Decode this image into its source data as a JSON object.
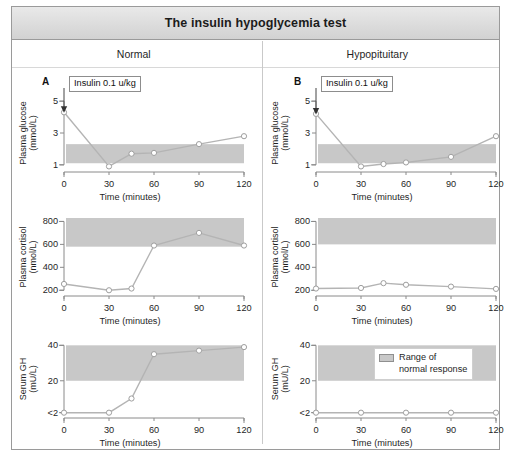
{
  "figure": {
    "title": "The insulin hypoglycemia test",
    "columns": [
      {
        "label": "Normal"
      },
      {
        "label": "Hypopituitary"
      }
    ],
    "panel_letters": {
      "normal": "A",
      "hypopituitary": "B"
    },
    "annotation": {
      "text": "Insulin 0.1 u/kg"
    },
    "legend": {
      "line1": "Range of",
      "line2": "normal response",
      "swatch_color": "#c8c8c8"
    },
    "colors": {
      "band": "#c8c8c8",
      "line": "#b4b4b4",
      "marker_fill": "#ffffff",
      "marker_stroke": "#9e9e9e",
      "axis": "#8a8a8a",
      "text": "#1f1f1f",
      "title_bg": "#dcdcdc",
      "frame": "#9a9a9a"
    }
  },
  "chart_data": [
    {
      "id": "glucose-normal",
      "type": "line",
      "panel": "A",
      "column": "Normal",
      "title": "",
      "ylabel_line1": "Plasma glucose",
      "ylabel_line2": "(mmol/L)",
      "xlabel": "Time (minutes)",
      "x": [
        0,
        30,
        45,
        60,
        90,
        120
      ],
      "values": [
        4.3,
        0.9,
        1.7,
        1.75,
        2.3,
        2.8
      ],
      "xticks": [
        0,
        30,
        60,
        90,
        120
      ],
      "xticklabels": [
        "0",
        "30",
        "60",
        "90",
        "120"
      ],
      "yticks": [
        1,
        3,
        5
      ],
      "yticklabels": [
        "1",
        "3",
        "5"
      ],
      "xlim": [
        0,
        120
      ],
      "ylim": [
        0.55,
        5.45
      ],
      "normal_band": [
        1.1,
        2.3
      ],
      "grid": false,
      "annotation_at_x": 0
    },
    {
      "id": "glucose-hypopituitary",
      "type": "line",
      "panel": "B",
      "column": "Hypopituitary",
      "title": "",
      "ylabel_line1": "Plasma glucose",
      "ylabel_line2": "(mmol/L)",
      "xlabel": "Time (minutes)",
      "x": [
        0,
        30,
        45,
        60,
        90,
        120
      ],
      "values": [
        4.2,
        0.9,
        1.05,
        1.15,
        1.5,
        2.8
      ],
      "xticks": [
        0,
        30,
        60,
        90,
        120
      ],
      "xticklabels": [
        "0",
        "30",
        "60",
        "90",
        "120"
      ],
      "yticks": [
        1,
        3,
        5
      ],
      "yticklabels": [
        "1",
        "3",
        "5"
      ],
      "xlim": [
        0,
        120
      ],
      "ylim": [
        0.55,
        5.45
      ],
      "normal_band": [
        1.1,
        2.3
      ],
      "grid": false,
      "annotation_at_x": 0
    },
    {
      "id": "cortisol-normal",
      "type": "line",
      "panel": "A",
      "column": "Normal",
      "title": "",
      "ylabel_line1": "Plasma cortisol",
      "ylabel_line2": "(nmol/L)",
      "xlabel": "Time (minutes)",
      "x": [
        0,
        30,
        45,
        60,
        90,
        120
      ],
      "values": [
        255,
        200,
        215,
        590,
        700,
        590
      ],
      "xticks": [
        0,
        30,
        60,
        90,
        120
      ],
      "xticklabels": [
        "0",
        "30",
        "60",
        "90",
        "120"
      ],
      "yticks": [
        200,
        400,
        600,
        800
      ],
      "yticklabels": [
        "200",
        "400",
        "600",
        "800"
      ],
      "xlim": [
        0,
        120
      ],
      "ylim": [
        150,
        830
      ],
      "normal_band": [
        580,
        830
      ],
      "grid": false
    },
    {
      "id": "cortisol-hypopituitary",
      "type": "line",
      "panel": "B",
      "column": "Hypopituitary",
      "title": "",
      "ylabel_line1": "Plasma cortisol",
      "ylabel_line2": "(nmol/L)",
      "xlabel": "Time (minutes)",
      "x": [
        0,
        30,
        45,
        60,
        90,
        120
      ],
      "values": [
        215,
        220,
        262,
        248,
        232,
        212
      ],
      "xticks": [
        0,
        30,
        60,
        90,
        120
      ],
      "xticklabels": [
        "0",
        "30",
        "60",
        "90",
        "120"
      ],
      "yticks": [
        200,
        400,
        600,
        800
      ],
      "yticklabels": [
        "200",
        "400",
        "600",
        "800"
      ],
      "xlim": [
        0,
        120
      ],
      "ylim": [
        150,
        830
      ],
      "normal_band": [
        600,
        830
      ],
      "grid": false
    },
    {
      "id": "gh-normal",
      "type": "line",
      "panel": "A",
      "column": "Normal",
      "title": "",
      "ylabel_line1": "Serum GH",
      "ylabel_line2": "(mU/L)",
      "xlabel": "Time (minutes)",
      "x": [
        0,
        30,
        45,
        60,
        90,
        120
      ],
      "values": [
        2,
        2,
        10,
        35,
        37,
        39
      ],
      "xticks": [
        0,
        30,
        60,
        90,
        120
      ],
      "xticklabels": [
        "0",
        "30",
        "60",
        "90",
        "120"
      ],
      "yticks": [
        2,
        20,
        40
      ],
      "yticklabels": [
        "<2",
        "20",
        "40"
      ],
      "xlim": [
        0,
        120
      ],
      "ylim": [
        -1,
        43
      ],
      "normal_band": [
        20,
        40
      ],
      "grid": false
    },
    {
      "id": "gh-hypopituitary",
      "type": "line",
      "panel": "B",
      "column": "Hypopituitary",
      "title": "",
      "ylabel_line1": "Serum GH",
      "ylabel_line2": "(mU/L)",
      "xlabel": "Time (minutes)",
      "x": [
        0,
        30,
        60,
        90,
        120
      ],
      "values": [
        2,
        2,
        2,
        2,
        2
      ],
      "xticks": [
        0,
        30,
        60,
        90,
        120
      ],
      "xticklabels": [
        "0",
        "30",
        "60",
        "90",
        "120"
      ],
      "yticks": [
        2,
        20,
        40
      ],
      "yticklabels": [
        "<2",
        "20",
        "40"
      ],
      "xlim": [
        0,
        120
      ],
      "ylim": [
        -1,
        43
      ],
      "normal_band": [
        20,
        40
      ],
      "grid": false,
      "has_legend": true
    }
  ]
}
